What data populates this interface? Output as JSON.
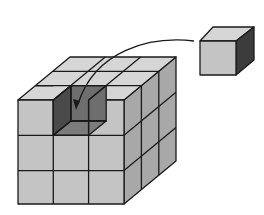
{
  "diagram": {
    "large_cube": {
      "grid": [
        3,
        3,
        3
      ],
      "missing_cell": "top-front-middle"
    },
    "small_cube": {
      "count": 1
    },
    "arrow": {
      "from": "small-cube",
      "to": "missing-cell",
      "style": "curved"
    },
    "colors": {
      "top_face": "#d6d6d6",
      "front_face": "#c4c4c4",
      "side_face": "#a8a8a8",
      "cavity_dark": "#4a4a4a",
      "cavity_mid": "#6e6e6e",
      "small_side": "#3c3c3c",
      "edge": "#1a1a1a"
    }
  }
}
